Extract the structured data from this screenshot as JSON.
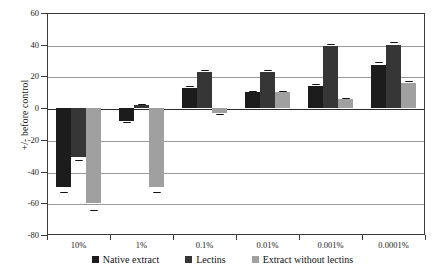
{
  "chart_data": {
    "type": "bar",
    "title": "",
    "xlabel": "",
    "ylabel": "+/- before control",
    "categories": [
      "10%",
      "1%",
      "0.1%",
      "0.01%",
      "0.001%",
      "0.0001%"
    ],
    "series": [
      {
        "name": "Native extract",
        "color": "#1c1c1c",
        "values": [
          -50,
          -8,
          13,
          10,
          14,
          27
        ],
        "errors": [
          3,
          1,
          1,
          1,
          1.5,
          2
        ]
      },
      {
        "name": "Lectins",
        "color": "#363636",
        "values": [
          -31,
          2,
          23,
          23,
          39,
          40
        ],
        "errors": [
          1.5,
          0.5,
          1,
          1,
          1.5,
          1.5
        ]
      },
      {
        "name": "Extract without lectins",
        "color": "#a0a0a0",
        "values": [
          -60,
          -50,
          -3,
          10,
          6,
          16
        ],
        "errors": [
          4,
          3,
          0.5,
          1,
          0.5,
          1
        ]
      }
    ],
    "ylim": [
      -80,
      60
    ],
    "yticks": [
      60,
      40,
      20,
      0,
      -20,
      -40,
      -60,
      -80
    ],
    "ytick_labels": [
      "60",
      "40",
      "20",
      "0",
      "-20",
      "-40",
      "-60",
      "-80"
    ],
    "grid": true,
    "legend_position": "bottom",
    "axis_color": "#3c3c3c",
    "grid_color": "#9a9a9a",
    "zero_line_color": "#2a2a2a"
  }
}
